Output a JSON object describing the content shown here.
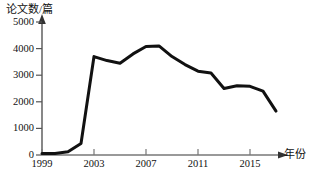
{
  "chart_data": {
    "type": "line",
    "title": "",
    "ylabel": "论文数/篇",
    "xlabel": "年份",
    "xlim": [
      1999,
      2018
    ],
    "ylim": [
      0,
      5400
    ],
    "grid": false,
    "legend": null,
    "y_ticks": [
      0,
      1000,
      2000,
      3000,
      4000,
      5000
    ],
    "y_tick_labels": [
      "0",
      "1000",
      "2000",
      "3000",
      "4000",
      "5000"
    ],
    "x_ticks": [
      1999,
      2003,
      2007,
      2011,
      2015
    ],
    "x_tick_labels": [
      "1999",
      "2003",
      "2007",
      "2011",
      "2015"
    ],
    "line_color": "#111111",
    "axis_color": "#555555",
    "series": [
      {
        "name": "论文数",
        "x": [
          1999,
          2000,
          2001,
          2002,
          2003,
          2004,
          2005,
          2006,
          2007,
          2008,
          2009,
          2010,
          2011,
          2012,
          2013,
          2014,
          2015,
          2016,
          2017
        ],
        "values": [
          60,
          60,
          120,
          430,
          3700,
          3550,
          3450,
          3800,
          4080,
          4100,
          3700,
          3400,
          3150,
          3080,
          2500,
          2600,
          2580,
          2400,
          1650
        ]
      }
    ]
  }
}
